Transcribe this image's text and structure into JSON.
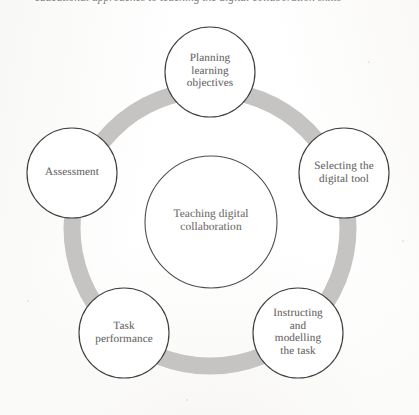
{
  "figure": {
    "caption": "educational approaches to teaching the digital collaboration skills",
    "center": {
      "label": "Teaching digital collaboration",
      "lines": [
        "Teaching digital",
        "collaboration"
      ]
    },
    "ring": {
      "color": "#c3c2c0",
      "outline_color": "#4a4a4a",
      "fill_color": "#ffffff"
    },
    "nodes": [
      {
        "id": "planning-learning-objectives",
        "label": "Planning learning objectives",
        "lines": [
          "Planning",
          "learning",
          "objectives"
        ],
        "position": "top"
      },
      {
        "id": "selecting-the-digital-tool",
        "label": "Selecting the digital tool",
        "lines": [
          "Selecting the",
          "digital tool"
        ],
        "position": "right"
      },
      {
        "id": "instructing-and-modelling-the-task",
        "label": "Instructing and modelling the task",
        "lines": [
          "Instructing",
          "and",
          "modelling",
          "the task"
        ],
        "position": "bottom-right"
      },
      {
        "id": "task-performance",
        "label": "Task performance",
        "lines": [
          "Task",
          "performance"
        ],
        "position": "bottom-left"
      },
      {
        "id": "assessment",
        "label": "Assessment",
        "lines": [
          "Assessment"
        ],
        "position": "left"
      }
    ]
  }
}
